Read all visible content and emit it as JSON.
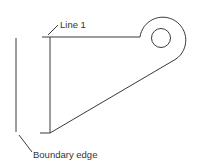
{
  "diagram": {
    "labels": {
      "line1": "Line 1",
      "boundary": "Boundary edge"
    },
    "colors": {
      "stroke": "#3a3a3a",
      "background": "#ffffff"
    }
  }
}
